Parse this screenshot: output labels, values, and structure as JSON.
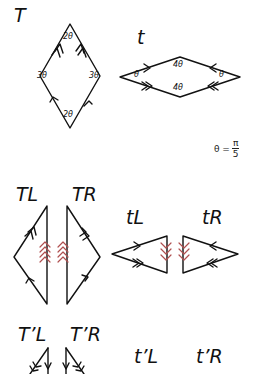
{
  "labels": {
    "T": "T",
    "t": "t",
    "TL": "TL",
    "TR": "TR",
    "tL": "tL",
    "tR": "tR",
    "TpL": "T’L",
    "TpR": "T’R",
    "tpL": "t’L",
    "tpR": "t’R"
  },
  "angles": {
    "T_top": "2θ",
    "T_bottom": "2θ",
    "T_left": "3θ",
    "T_right": "3θ",
    "t_top": "4θ",
    "t_bottom": "4θ",
    "t_left": "θ",
    "t_right": "θ"
  },
  "formula": {
    "lhs": "θ =",
    "numerator": "π",
    "denominator": "5"
  },
  "colors": {
    "stroke": "#111111",
    "matching_arrows": "#b05050"
  }
}
